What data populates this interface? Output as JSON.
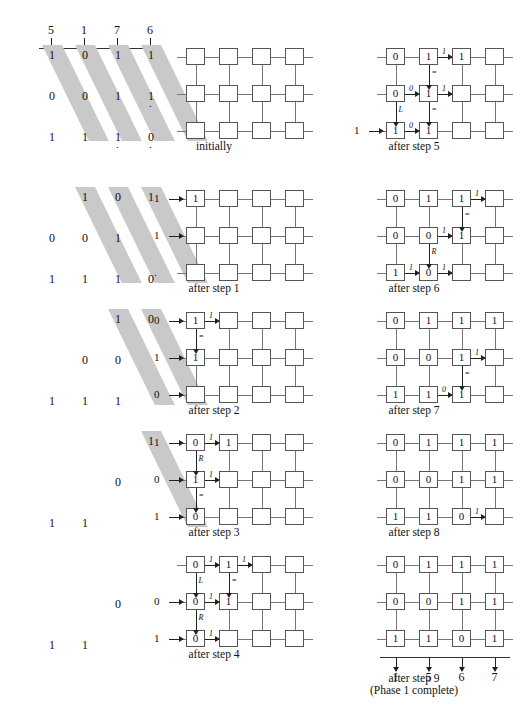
{
  "figure": {
    "title_visible_partial": "",
    "header_numbers": [
      "5",
      "1",
      "7",
      "6"
    ],
    "final_output_numbers": [
      "1",
      "5",
      "6",
      "7"
    ]
  },
  "panels": [
    {
      "id": "initially",
      "caption": "initially",
      "input_rows": [
        [
          "1",
          "0",
          "1",
          "1"
        ],
        [
          "0",
          "0",
          "1",
          "1"
        ],
        [
          "1",
          "1",
          "1",
          "0"
        ]
      ],
      "trailing_dots": [
        [
          "",
          "",
          "",
          ""
        ],
        [
          "",
          "",
          "",
          "."
        ],
        [
          "",
          "",
          ".",
          "."
        ]
      ],
      "mesh": [
        [
          "",
          "",
          "",
          ""
        ],
        [
          "",
          "",
          "",
          ""
        ],
        [
          "",
          "",
          "",
          ""
        ]
      ],
      "side_inputs": [
        "",
        "",
        ""
      ],
      "arrows": []
    },
    {
      "id": "after-step-1",
      "caption": "after step 1",
      "input_rows": [
        [
          "",
          "1",
          "0",
          "1"
        ],
        [
          "0",
          "0",
          "1",
          ""
        ],
        [
          "1",
          "1",
          "1",
          "0"
        ]
      ],
      "mesh": [
        [
          "1",
          "",
          "",
          ""
        ],
        [
          "",
          "",
          "",
          ""
        ],
        [
          "",
          "",
          "",
          ""
        ]
      ],
      "side_inputs": [
        "1",
        "1",
        "."
      ],
      "arrows": []
    },
    {
      "id": "after-step-2",
      "caption": "after step 2",
      "input_rows": [
        [
          "",
          "",
          "1",
          "0"
        ],
        [
          "",
          "0",
          "0",
          ""
        ],
        [
          "1",
          "1",
          "1",
          ""
        ]
      ],
      "mesh": [
        [
          "1",
          "",
          "",
          ""
        ],
        [
          "1",
          "",
          "",
          ""
        ],
        [
          "",
          "",
          "",
          ""
        ]
      ],
      "side_inputs": [
        "0",
        "1",
        "0"
      ],
      "arrows": [
        {
          "type": "right",
          "label": "1",
          "row": 0,
          "col": 0
        },
        {
          "type": "down",
          "label": "=",
          "row": 0,
          "col": 0
        }
      ]
    },
    {
      "id": "after-step-3",
      "caption": "after step 3",
      "input_rows": [
        [
          "",
          "",
          "",
          "1"
        ],
        [
          "",
          "",
          "0",
          ""
        ],
        [
          "1",
          "1",
          "",
          ""
        ]
      ],
      "mesh": [
        [
          "0",
          "1",
          "",
          ""
        ],
        [
          "1",
          "",
          "",
          ""
        ],
        [
          "0",
          "",
          "",
          ""
        ]
      ],
      "side_inputs": [
        "1",
        "0",
        "1"
      ],
      "arrows": [
        {
          "type": "right",
          "label": "1",
          "row": 0,
          "col": 0
        },
        {
          "type": "down",
          "label": "R",
          "row": 0,
          "col": 0
        },
        {
          "type": "right",
          "label": "1",
          "row": 1,
          "col": 0
        },
        {
          "type": "down",
          "label": "=",
          "row": 1,
          "col": 0
        }
      ]
    },
    {
      "id": "after-step-4",
      "caption": "after step 4",
      "input_rows": [
        [
          "",
          "",
          "",
          ""
        ],
        [
          "",
          "",
          "0",
          ""
        ],
        [
          "1",
          "1",
          "",
          ""
        ]
      ],
      "mesh": [
        [
          "0",
          "1",
          "",
          ""
        ],
        [
          "0",
          "1",
          "",
          ""
        ],
        [
          "0",
          "",
          "",
          ""
        ]
      ],
      "side_inputs": [
        "",
        "0",
        "1"
      ],
      "arrows": [
        {
          "type": "right",
          "label": "1",
          "row": 0,
          "col": 0
        },
        {
          "type": "right",
          "label": "1",
          "row": 0,
          "col": 1
        },
        {
          "type": "down",
          "label": "L",
          "row": 0,
          "col": 0
        },
        {
          "type": "down",
          "label": "=",
          "row": 0,
          "col": 1
        },
        {
          "type": "right",
          "label": "1",
          "row": 1,
          "col": 0
        },
        {
          "type": "down",
          "label": "R",
          "row": 1,
          "col": 0
        },
        {
          "type": "right",
          "label": "1",
          "row": 2,
          "col": 0
        }
      ]
    },
    {
      "id": "after-step-5",
      "caption": "after step 5",
      "mesh": [
        [
          "0",
          "1",
          "1",
          ""
        ],
        [
          "0",
          "1",
          "",
          ""
        ],
        [
          "1",
          "1",
          "",
          ""
        ]
      ],
      "side_inputs": [
        "",
        "",
        "1"
      ],
      "arrows": [
        {
          "type": "right",
          "label": "1",
          "row": 0,
          "col": 1
        },
        {
          "type": "down",
          "label": "=",
          "row": 0,
          "col": 1
        },
        {
          "type": "right",
          "label": "0",
          "row": 1,
          "col": 0
        },
        {
          "type": "right",
          "label": "1",
          "row": 1,
          "col": 1
        },
        {
          "type": "down",
          "label": "=",
          "row": 1,
          "col": 1
        },
        {
          "type": "down",
          "label": "L",
          "row": 1,
          "col": 0
        },
        {
          "type": "right",
          "label": "0",
          "row": 2,
          "col": 0
        }
      ]
    },
    {
      "id": "after-step-6",
      "caption": "after step 6",
      "mesh": [
        [
          "0",
          "1",
          "1",
          ""
        ],
        [
          "0",
          "0",
          "1",
          ""
        ],
        [
          "1",
          "0",
          "",
          ""
        ]
      ],
      "side_inputs": [
        "",
        "",
        ""
      ],
      "arrows": [
        {
          "type": "right",
          "label": "1",
          "row": 0,
          "col": 2
        },
        {
          "type": "down",
          "label": "=",
          "row": 0,
          "col": 2
        },
        {
          "type": "right",
          "label": "1",
          "row": 1,
          "col": 1
        },
        {
          "type": "down",
          "label": "R",
          "row": 1,
          "col": 1
        },
        {
          "type": "right",
          "label": "1",
          "row": 2,
          "col": 0
        },
        {
          "type": "right",
          "label": "1",
          "row": 2,
          "col": 1
        }
      ]
    },
    {
      "id": "after-step-7",
      "caption": "after step 7",
      "mesh": [
        [
          "0",
          "1",
          "1",
          "1"
        ],
        [
          "0",
          "0",
          "1",
          ""
        ],
        [
          "1",
          "1",
          "1",
          ""
        ]
      ],
      "side_inputs": [
        "",
        "",
        ""
      ],
      "arrows": [
        {
          "type": "right",
          "label": "1",
          "row": 1,
          "col": 2
        },
        {
          "type": "down",
          "label": "=",
          "row": 1,
          "col": 2
        },
        {
          "type": "right",
          "label": "0",
          "row": 2,
          "col": 1
        }
      ]
    },
    {
      "id": "after-step-8",
      "caption": "after step 8",
      "mesh": [
        [
          "0",
          "1",
          "1",
          "1"
        ],
        [
          "0",
          "0",
          "1",
          "1"
        ],
        [
          "1",
          "1",
          "0",
          ""
        ]
      ],
      "side_inputs": [
        "",
        "",
        ""
      ],
      "arrows": [
        {
          "type": "right",
          "label": "1",
          "row": 2,
          "col": 2
        }
      ]
    },
    {
      "id": "after-step-9",
      "caption": "after step 9\n(Phase 1 complete)",
      "mesh": [
        [
          "0",
          "1",
          "1",
          "1"
        ],
        [
          "0",
          "0",
          "1",
          "1"
        ],
        [
          "1",
          "1",
          "0",
          "1"
        ]
      ],
      "side_inputs": [
        "",
        "",
        ""
      ],
      "arrows": [],
      "outputs": [
        "1",
        "5",
        "6",
        "7"
      ]
    }
  ]
}
